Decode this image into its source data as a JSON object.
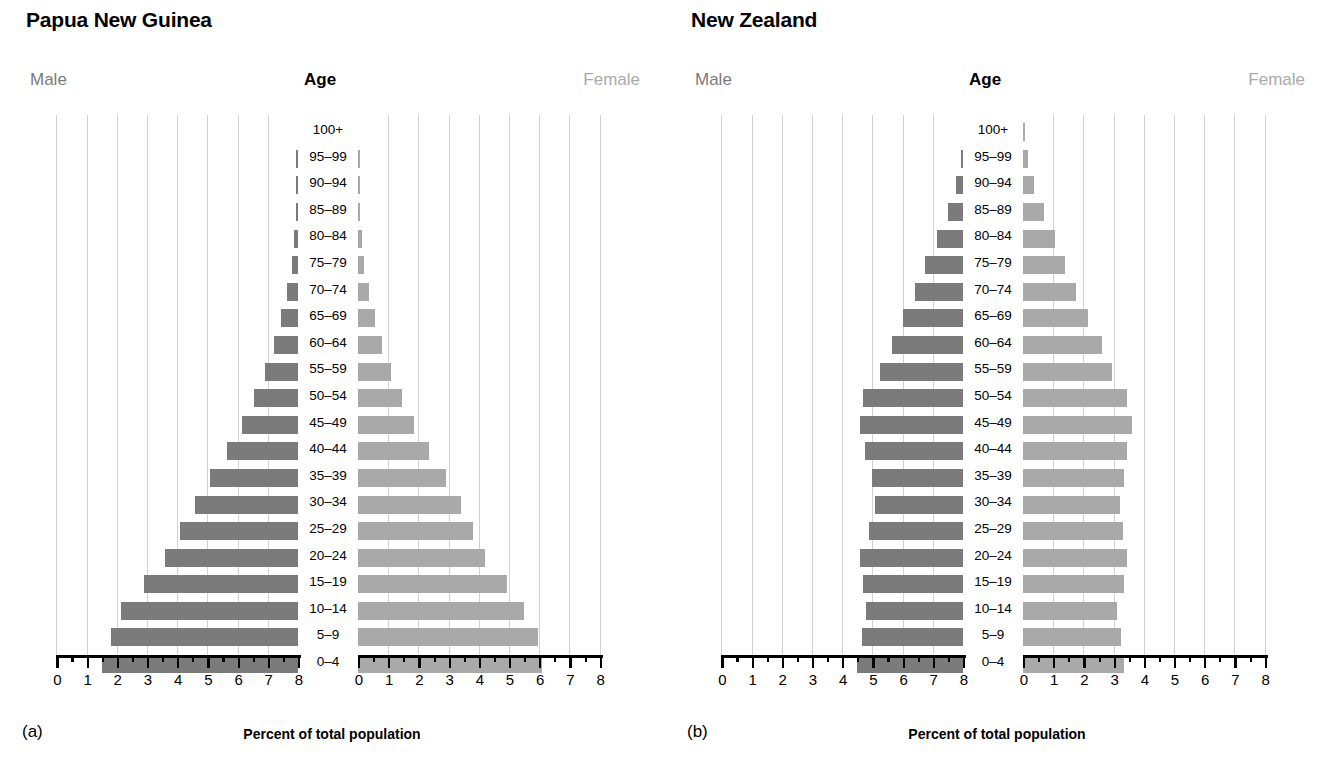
{
  "figure": {
    "axis_caption": "Percent of total population",
    "header_male": "Male",
    "header_age": "Age",
    "header_female": "Female",
    "male_color": "#7b7b7b",
    "female_color": "#a9a9a9",
    "gridline_color": "#d2d2d2"
  },
  "panels": [
    {
      "letter": "(a)",
      "title": "Papua New Guinea"
    },
    {
      "letter": "(b)",
      "title": "New Zealand"
    }
  ],
  "axis": {
    "tick_labels_left": [
      "8",
      "7",
      "6",
      "5",
      "4",
      "3",
      "2",
      "1",
      "0"
    ],
    "tick_labels_right": [
      "0",
      "1",
      "2",
      "3",
      "4",
      "5",
      "6",
      "7",
      "8"
    ],
    "min": 0,
    "max": 8,
    "major_step": 1,
    "minor_step": 0.5
  },
  "chart_data": [
    {
      "type": "bar",
      "title": "Papua New Guinea",
      "subtitle": "(a)",
      "orientation": "horizontal",
      "layout": "population-pyramid",
      "xlabel": "Percent of total population",
      "ylabel": "Age",
      "xlim": [
        0,
        8
      ],
      "grid": true,
      "legend": [
        "Male",
        "Female"
      ],
      "legend_position": "top-outside",
      "categories": [
        "100+",
        "95–99",
        "90–94",
        "85–89",
        "80–84",
        "75–79",
        "70–74",
        "65–69",
        "60–64",
        "55–59",
        "50–54",
        "45–49",
        "40–44",
        "35–39",
        "30–34",
        "25–29",
        "20–24",
        "15–19",
        "10–14",
        "5–9",
        "0–4"
      ],
      "series": [
        {
          "name": "Male",
          "values": [
            0.0,
            0.03,
            0.05,
            0.08,
            0.12,
            0.2,
            0.35,
            0.55,
            0.8,
            1.1,
            1.45,
            1.85,
            2.35,
            2.9,
            3.4,
            3.9,
            4.4,
            5.1,
            5.85,
            6.2,
            6.5
          ]
        },
        {
          "name": "Female",
          "values": [
            0.0,
            0.03,
            0.05,
            0.08,
            0.12,
            0.2,
            0.35,
            0.55,
            0.8,
            1.1,
            1.45,
            1.85,
            2.35,
            2.9,
            3.4,
            3.8,
            4.2,
            4.95,
            5.5,
            5.95,
            6.1
          ]
        }
      ]
    },
    {
      "type": "bar",
      "title": "New Zealand",
      "subtitle": "(b)",
      "orientation": "horizontal",
      "layout": "population-pyramid",
      "xlabel": "Percent of total population",
      "ylabel": "Age",
      "xlim": [
        0,
        8
      ],
      "grid": true,
      "legend": [
        "Male",
        "Female"
      ],
      "legend_position": "top-outside",
      "categories": [
        "100+",
        "95–99",
        "90–94",
        "85–89",
        "80–84",
        "75–79",
        "70–74",
        "65–69",
        "60–64",
        "55–59",
        "50–54",
        "45–49",
        "40–44",
        "35–39",
        "30–34",
        "25–29",
        "20–24",
        "15–19",
        "10–14",
        "5–9",
        "0–4"
      ],
      "series": [
        {
          "name": "Male",
          "values": [
            0.0,
            0.08,
            0.22,
            0.5,
            0.85,
            1.25,
            1.6,
            2.0,
            2.35,
            2.75,
            3.3,
            3.4,
            3.25,
            3.0,
            2.9,
            3.1,
            3.4,
            3.3,
            3.2,
            3.35,
            3.5
          ]
        },
        {
          "name": "Female",
          "values": [
            0.02,
            0.15,
            0.35,
            0.7,
            1.05,
            1.4,
            1.75,
            2.15,
            2.6,
            2.95,
            3.45,
            3.6,
            3.45,
            3.35,
            3.2,
            3.3,
            3.45,
            3.35,
            3.1,
            3.25,
            3.35
          ]
        }
      ]
    }
  ]
}
